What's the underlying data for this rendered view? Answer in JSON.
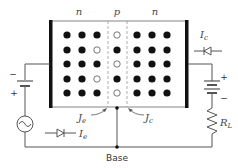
{
  "diagram": {
    "regions": [
      {
        "label": "n",
        "name": "emitter"
      },
      {
        "label": "p",
        "name": "base"
      },
      {
        "label": "n",
        "name": "collector"
      }
    ],
    "carriers": {
      "legend": {
        "electron": "filled dot",
        "hole": "open circle"
      },
      "emitter_rows": [
        [
          "e",
          "e",
          "e"
        ],
        [
          "e",
          "e",
          "h"
        ],
        [
          "e",
          "e",
          "e"
        ],
        [
          "e",
          "e",
          "h"
        ],
        [
          "e",
          "e",
          "e"
        ]
      ],
      "base_rows": [
        [
          "h"
        ],
        [
          "e"
        ],
        [
          "h"
        ],
        [
          "e"
        ],
        [
          "h"
        ]
      ],
      "collector_rows": [
        [
          "e",
          "e",
          "e"
        ],
        [
          "e",
          "e",
          "e"
        ],
        [
          "e",
          "e",
          "e"
        ],
        [
          "e",
          "e",
          "e"
        ],
        [
          "e",
          "e",
          "e"
        ]
      ]
    },
    "labels": {
      "je_left": "J",
      "je_left_sub": "e",
      "jc_right": "J",
      "jc_right_sub": "c",
      "ie": "I",
      "ie_sub": "e",
      "ic": "I",
      "ic_sub": "c",
      "rl": "R",
      "rl_sub": "L",
      "base": "Base",
      "emitter_battery_minus": "−",
      "emitter_battery_plus": "+",
      "collector_battery_plus": "+",
      "collector_battery_minus": "−"
    },
    "colors": {
      "electron": "#111111",
      "hole_stroke": "#555555",
      "wire": "#555555",
      "contact": "#111111"
    }
  }
}
